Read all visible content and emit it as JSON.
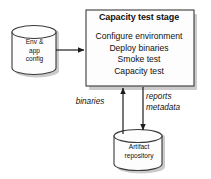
{
  "diagram": {
    "type": "flow-diagram",
    "background_color": "#ffffff",
    "stroke_color": "#3a3a3a",
    "fill_color": "#fdfdfd",
    "shadow_color": "#9a9a9a",
    "text_color": "#111111",
    "stage": {
      "title": "Capacity test stage",
      "steps_text": "Configure environment\nDeploy binaries\nSmoke test\nCapacity test",
      "steps": [
        "Configure environment",
        "Deploy binaries",
        "Smoke test",
        "Capacity test"
      ]
    },
    "env_store": {
      "label": "Env &\napp\nconfig",
      "lines": [
        "Env &",
        "app",
        "config"
      ]
    },
    "artifact_store": {
      "label": "Artifact\nrepository",
      "lines": [
        "Artifact",
        "repository"
      ]
    },
    "edges": [
      {
        "id": "config-to-stage",
        "label": "",
        "from": "env_store",
        "to": "stage",
        "direction": "right"
      },
      {
        "id": "binaries-to-stage",
        "label": "binaries",
        "from": "artifact_store",
        "to": "stage",
        "direction": "up"
      },
      {
        "id": "reports-to-artifact",
        "label": "reports\nmetadata",
        "from": "stage",
        "to": "artifact_store",
        "direction": "down"
      }
    ]
  }
}
